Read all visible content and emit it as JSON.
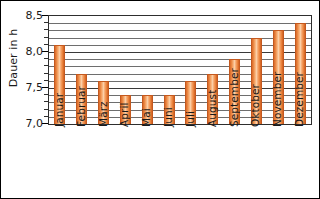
{
  "chart_data": {
    "type": "bar",
    "title": "",
    "xlabel": "",
    "ylabel": "Dauer in h",
    "categories": [
      "Januar",
      "Februar",
      "März",
      "April",
      "Mai",
      "Juni",
      "Juli",
      "August",
      "September",
      "Oktober",
      "November",
      "Dezember"
    ],
    "values": [
      8.1,
      7.7,
      7.6,
      7.4,
      7.4,
      7.4,
      7.6,
      7.7,
      7.9,
      8.2,
      8.3,
      8.4
    ],
    "ylim": [
      7.0,
      8.5
    ],
    "ytick_labels": [
      "7,0",
      "7,5",
      "8,0",
      "8,5"
    ],
    "ytick_values": [
      7.0,
      7.5,
      8.0,
      8.5
    ],
    "minor_tick_step": 0.1,
    "grid": true,
    "grid_axis": "y",
    "legend": "none",
    "bar_color": "#ef8b3c",
    "bar_edge_color": "#c4591f",
    "grid_color": "#6e6e6e",
    "axis_color": "#2e2e2e",
    "text_color": "#1a1a1a"
  }
}
